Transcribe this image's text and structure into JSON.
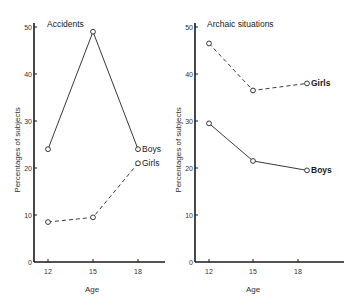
{
  "chart_data": [
    {
      "type": "line",
      "title": "Accidents",
      "xlabel": "Age",
      "ylabel": "Percentages of subjects",
      "categories": [
        "12",
        "15",
        "18"
      ],
      "x": [
        12,
        15,
        18
      ],
      "ylim": [
        0,
        50
      ],
      "yticks": [
        0,
        10,
        20,
        30,
        40,
        50
      ],
      "grid": false,
      "series": [
        {
          "name": "Boys",
          "style": "solid",
          "values": [
            24,
            49,
            24
          ]
        },
        {
          "name": "Girls",
          "style": "dashed",
          "values": [
            8.5,
            9.5,
            21
          ]
        }
      ]
    },
    {
      "type": "line",
      "title": "Archaic situations",
      "xlabel": "Age",
      "ylabel": "Percentages of subjects",
      "categories": [
        "12",
        "15",
        "18"
      ],
      "x": [
        12,
        15,
        18
      ],
      "ylim": [
        0,
        50
      ],
      "yticks": [
        0,
        10,
        20,
        30,
        40,
        50
      ],
      "grid": false,
      "series": [
        {
          "name": "Girls",
          "style": "dashed",
          "label_bold": true,
          "values": [
            46.5,
            36.5,
            38
          ]
        },
        {
          "name": "Boys",
          "style": "solid",
          "label_bold": true,
          "values": [
            29.5,
            21.5,
            19.5
          ]
        }
      ]
    }
  ]
}
